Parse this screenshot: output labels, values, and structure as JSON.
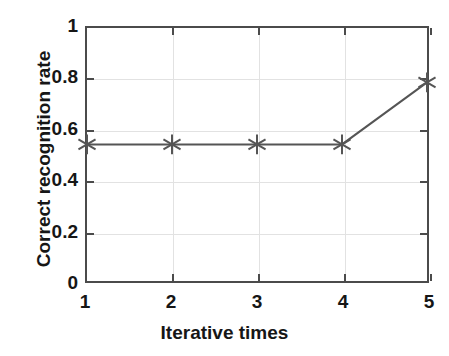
{
  "chart_data": {
    "type": "line",
    "title": "",
    "xlabel": "Iterative times",
    "ylabel": "Correct recognition rate",
    "x": [
      1,
      2,
      3,
      4,
      5
    ],
    "values": [
      0.54,
      0.54,
      0.54,
      0.54,
      0.785
    ],
    "series": [
      {
        "name": "Correct recognition rate",
        "values": [
          0.54,
          0.54,
          0.54,
          0.54,
          0.785
        ]
      }
    ],
    "xlim": [
      1,
      5
    ],
    "ylim": [
      0,
      1
    ],
    "xticks": [
      "1",
      "2",
      "3",
      "4",
      "5"
    ],
    "xtick_values": [
      1,
      2,
      3,
      4,
      5
    ],
    "yticks": [
      "0",
      "0.2",
      "0.4",
      "0.6",
      "0.8",
      "1"
    ],
    "ytick_values": [
      0,
      0.2,
      0.4,
      0.6,
      0.8,
      1
    ],
    "grid": true,
    "legend": null,
    "marker": "asterisk-6",
    "line_color": "#555555",
    "marker_color": "#555555",
    "axis_color": "#4b4b4b",
    "grid_color": "#e2e2e2",
    "background_color": "#ffffff"
  }
}
